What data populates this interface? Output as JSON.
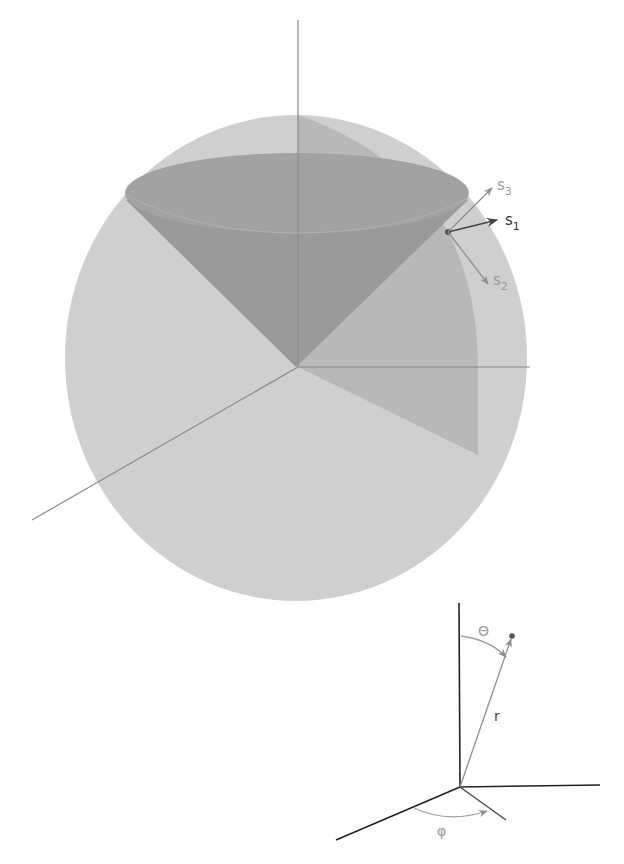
{
  "diagram": {
    "type": "spherical-coordinates-illustration",
    "colors": {
      "background": "#ffffff",
      "sphere": "#cfcfcf",
      "cone": "#9a9a9a",
      "cone_top": "#a3a3a3",
      "wedge": "#b4b4b4",
      "axis_light": "#8a8a8a",
      "axis_dark": "#222222",
      "vector_dark": "#444444",
      "vector_light": "#8f8f8f",
      "label_dark": "#333333",
      "label_light": "#9a9a9a"
    },
    "sphere_figure": {
      "vectors": [
        {
          "id": "s1",
          "label_base": "s",
          "label_sub": "1"
        },
        {
          "id": "s2",
          "label_base": "s",
          "label_sub": "2"
        },
        {
          "id": "s3",
          "label_base": "s",
          "label_sub": "3"
        }
      ]
    },
    "coordinate_figure": {
      "radius_label": "r",
      "polar_angle_label": "Θ",
      "azimuth_label": "φ"
    }
  }
}
